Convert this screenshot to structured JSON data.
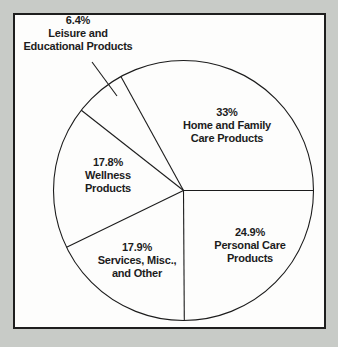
{
  "chart_data": {
    "type": "pie",
    "title": "",
    "unit": "percent",
    "start_angle_deg": 0,
    "direction": "clockwise",
    "legend_position": "labels-on-chart",
    "slices": [
      {
        "name": "Personal Care Products",
        "value": 24.9,
        "pct_label": "24.9%",
        "line1": "Personal Care",
        "line2": "Products"
      },
      {
        "name": "Services, Misc., and Other",
        "value": 17.9,
        "pct_label": "17.9%",
        "line1": "Services, Misc.,",
        "line2": "and Other"
      },
      {
        "name": "Wellness Products",
        "value": 17.8,
        "pct_label": "17.8%",
        "line1": "Wellness",
        "line2": "Products"
      },
      {
        "name": "Leisure and Educational Products",
        "value": 6.4,
        "pct_label": "6.4%",
        "line1": "Leisure and",
        "line2": "Educational Products"
      },
      {
        "name": "Home and Family Care Products",
        "value": 33,
        "pct_label": "33%",
        "line1": "Home and Family",
        "line2": "Care Products"
      }
    ],
    "colors": {
      "slice_fill": "#fdfdfc",
      "line_stroke": "#1c1c1c",
      "page_background": "#c8cbc7",
      "frame_border": "#1e1e1e"
    }
  }
}
